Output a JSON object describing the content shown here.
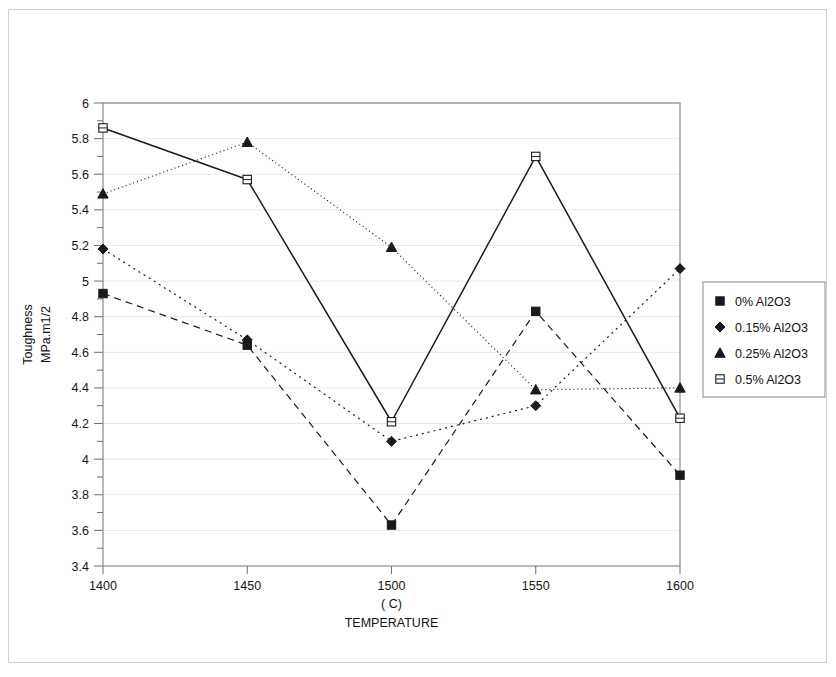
{
  "chart_data": {
    "type": "line",
    "title": "",
    "xlabel": "TEMPERATURE",
    "xlabel_unit": "( C)",
    "ylabel": "Toughness",
    "ylabel_unit": "MPa.m1/2",
    "x": [
      1400,
      1450,
      1500,
      1550,
      1600
    ],
    "xlim": [
      1400,
      1600
    ],
    "ylim": [
      3.4,
      6
    ],
    "xticks": [
      "1400",
      "1450",
      "1500",
      "1550",
      "1600"
    ],
    "yticks": [
      "3.4",
      "3.6",
      "3.8",
      "4",
      "4.2",
      "4.4",
      "4.6",
      "4.8",
      "5",
      "5.2",
      "5.4",
      "5.6",
      "5.8",
      "6"
    ],
    "y_minor_step": 0.1,
    "grid": "horizontal-major-faint",
    "legend_position": "right",
    "series": [
      {
        "name": "0% Al2O3",
        "marker": "filled-square",
        "line": "dashed",
        "color": "#1a1a1a",
        "values": [
          4.93,
          4.64,
          3.63,
          4.83,
          3.91
        ]
      },
      {
        "name": "0.15% Al2O3",
        "marker": "filled-diamond",
        "line": "dotted",
        "color": "#1a1a1a",
        "values": [
          5.18,
          4.67,
          4.1,
          4.3,
          5.07
        ]
      },
      {
        "name": "0.25% Al2O3",
        "marker": "filled-triangle",
        "line": "fine-dotted",
        "color": "#1a1a1a",
        "values": [
          5.49,
          5.78,
          5.19,
          4.39,
          4.4
        ]
      },
      {
        "name": "0.5% Al2O3",
        "marker": "open-square",
        "line": "solid",
        "color": "#1a1a1a",
        "values": [
          5.86,
          5.57,
          4.21,
          5.7,
          4.23
        ]
      }
    ]
  }
}
